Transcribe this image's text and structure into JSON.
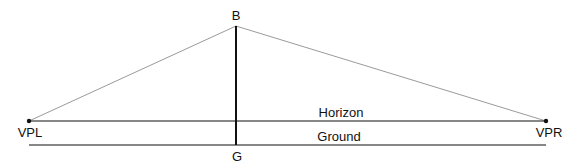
{
  "diagram": {
    "type": "two-point-perspective",
    "labels": {
      "top_point": "B",
      "bottom_point": "G",
      "left_vanishing_point": "VPL",
      "right_vanishing_point": "VPR",
      "horizon": "Horizon",
      "ground": "Ground"
    },
    "colors": {
      "lines": "#111111",
      "construction_lines": "#999999"
    }
  }
}
